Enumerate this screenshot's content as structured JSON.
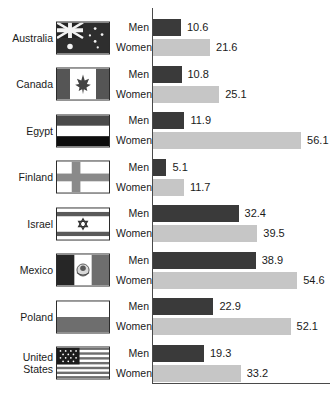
{
  "chart_data": {
    "type": "bar",
    "orientation": "horizontal",
    "title": "",
    "subtitle": "",
    "xlabel": "",
    "ylabel": "",
    "grid": false,
    "legend_position": "inline-row-labels",
    "axis_origin": 0,
    "xlim": [
      0,
      60
    ],
    "categories": [
      "Australia",
      "Canada",
      "Egypt",
      "Finland",
      "Israel",
      "Mexico",
      "Poland",
      "United States"
    ],
    "series": [
      {
        "name": "Men",
        "color": "#3a3a3a",
        "values": [
          10.6,
          10.8,
          11.9,
          5.1,
          32.4,
          38.9,
          22.9,
          19.3
        ]
      },
      {
        "name": "Women",
        "color": "#c6c6c6",
        "values": [
          21.6,
          25.1,
          56.1,
          11.7,
          39.5,
          54.6,
          52.1,
          33.2
        ]
      }
    ]
  },
  "rows": [
    {
      "country": "Australia",
      "flag": "flag-australia",
      "men_label": "Men",
      "women_label": "Women",
      "men_value": "10.6",
      "women_value": "21.6"
    },
    {
      "country": "Canada",
      "flag": "flag-canada",
      "men_label": "Men",
      "women_label": "Women",
      "men_value": "10.8",
      "women_value": "25.1"
    },
    {
      "country": "Egypt",
      "flag": "flag-egypt",
      "men_label": "Men",
      "women_label": "Women",
      "men_value": "11.9",
      "women_value": "56.1"
    },
    {
      "country": "Finland",
      "flag": "flag-finland",
      "men_label": "Men",
      "women_label": "Women",
      "men_value": "5.1",
      "women_value": "11.7"
    },
    {
      "country": "Israel",
      "flag": "flag-israel",
      "men_label": "Men",
      "women_label": "Women",
      "men_value": "32.4",
      "women_value": "39.5"
    },
    {
      "country": "Mexico",
      "flag": "flag-mexico",
      "men_label": "Men",
      "women_label": "Women",
      "men_value": "38.9",
      "women_value": "54.6"
    },
    {
      "country": "Poland",
      "flag": "flag-poland",
      "men_label": "Men",
      "women_label": "Women",
      "men_value": "22.9",
      "women_value": "52.1"
    },
    {
      "country": "United\nStates",
      "flag": "flag-united-states",
      "men_label": "Men",
      "women_label": "Women",
      "men_value": "19.3",
      "women_value": "33.2"
    }
  ],
  "colors": {
    "men_bar": "#3a3a3a",
    "women_bar": "#c6c6c6",
    "axis": "#4a4a4a",
    "text": "#1a1a1a",
    "background": "#ffffff"
  }
}
